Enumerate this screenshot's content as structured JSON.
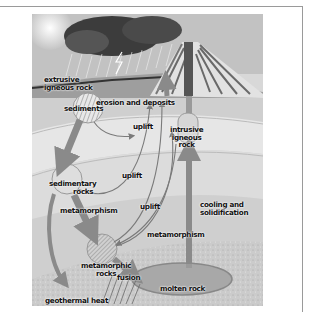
{
  "diagram": {
    "labels": {
      "extrusive_igneous_rock_1": "extrusive",
      "extrusive_igneous_rock_2": "igneous rock",
      "sediments": "sediments",
      "erosion_and_deposits": "erosion and deposits",
      "uplift_1": "uplift",
      "intrusive_igneous_rock_1": "intrusive",
      "intrusive_igneous_rock_2": "igneous",
      "intrusive_igneous_rock_3": "rock",
      "sedimentary_rocks_1": "sedimentary",
      "sedimentary_rocks_2": "rocks",
      "uplift_2": "uplift",
      "uplift_3": "uplift",
      "metamorphism_1": "metamorphism",
      "metamorphism_2": "metamorphism",
      "cooling_and_solidification_1": "cooling and",
      "cooling_and_solidification_2": "solidification",
      "metamorphic_rocks_1": "metamorphic",
      "metamorphic_rocks_2": "rocks",
      "fusion": "fusion",
      "molten_rock": "molten rock",
      "geothermal_heat": "geothermal heat"
    },
    "colors": {
      "sky": "#b8b8b8",
      "storm_cloud": "#3a3a3a",
      "ground": "#cfcfcf",
      "sediment_band": "#e6e6e6",
      "deep_layer": "#bdbdbd",
      "arrow": "#8a8a8a",
      "volcano_conduit": "#555555",
      "magma": "#a6a6a6"
    }
  }
}
